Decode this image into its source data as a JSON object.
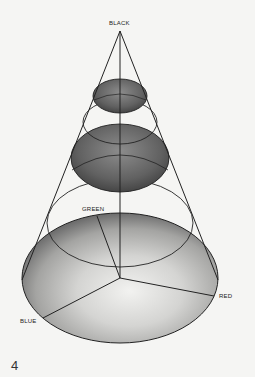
{
  "figure": {
    "labels": {
      "black": "BLACK",
      "green": "GREEN",
      "red": "RED",
      "blue": "BLUE"
    },
    "page_number": "4"
  },
  "colors": {
    "background": "#f5f5f3",
    "stroke": "#222222",
    "dark_shade": "#5a5a5a",
    "base_shade": "#8a8a8a"
  }
}
